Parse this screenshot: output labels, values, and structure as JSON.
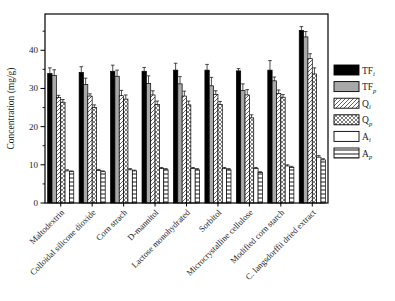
{
  "chart_data": {
    "type": "bar",
    "title": "",
    "xlabel": "",
    "ylabel": "Concentration (mg/g)",
    "ylim": [
      0,
      49.5
    ],
    "yticks_major": [
      0,
      10,
      20,
      30,
      40
    ],
    "yticks_minor": [
      5,
      15,
      25,
      35,
      45
    ],
    "grid": false,
    "legend_position": "right-outside",
    "categories": [
      "Maltodextrin",
      "Colloidal silicone dioxide",
      "Corn strach",
      "D-mannitol",
      "Lactose monohydrated",
      "Sorbitol",
      "Microcrystalline cellulose",
      "Modified corn starch",
      "C. langsdorffii dried extract"
    ],
    "series": [
      {
        "name": "TF",
        "sub": "i",
        "fill": "black",
        "color": "#000000",
        "values": [
          33.9,
          34.2,
          34.5,
          34.5,
          34.8,
          34.8,
          34.6,
          34.8,
          45.2
        ],
        "errors": [
          1.5,
          1.5,
          1.6,
          1.0,
          1.8,
          1.5,
          0.6,
          2.5,
          1.0
        ]
      },
      {
        "name": "TF",
        "sub": "p",
        "fill": "gray",
        "color": "#a8a8a8",
        "values": [
          33.4,
          31.0,
          33.2,
          31.3,
          31.2,
          30.7,
          29.5,
          32.0,
          43.5
        ],
        "errors": [
          1.5,
          1.7,
          1.6,
          2.0,
          1.9,
          2.2,
          1.7,
          1.0,
          1.4
        ]
      },
      {
        "name": "Q",
        "sub": "i",
        "fill": "diag",
        "color": "#ffffff",
        "values": [
          27.6,
          28.0,
          28.1,
          28.3,
          28.0,
          28.4,
          28.3,
          28.7,
          37.8
        ],
        "errors": [
          0.6,
          0.6,
          1.4,
          1.1,
          1.3,
          1.0,
          1.4,
          0.9,
          1.3
        ]
      },
      {
        "name": "Q",
        "sub": "p",
        "fill": "cross",
        "color": "#ffffff",
        "values": [
          26.4,
          25.0,
          27.2,
          25.8,
          25.7,
          25.8,
          22.3,
          27.7,
          33.8
        ],
        "errors": [
          0.7,
          0.7,
          1.1,
          0.9,
          1.0,
          0.8,
          0.8,
          0.7,
          1.6
        ]
      },
      {
        "name": "A",
        "sub": "i",
        "fill": "plain",
        "color": "#ffffff",
        "values": [
          8.4,
          8.5,
          8.7,
          9.0,
          9.0,
          9.0,
          9.0,
          9.7,
          12.0
        ],
        "errors": [
          0.3,
          0.3,
          0.3,
          0.3,
          0.3,
          0.3,
          0.3,
          0.3,
          0.4
        ]
      },
      {
        "name": "A",
        "sub": "p",
        "fill": "hlines",
        "color": "#ffffff",
        "values": [
          8.2,
          8.2,
          8.4,
          8.7,
          8.7,
          8.7,
          8.0,
          9.3,
          11.3
        ],
        "errors": [
          0.2,
          0.2,
          0.2,
          0.3,
          0.3,
          0.3,
          0.2,
          0.3,
          0.3
        ]
      }
    ]
  }
}
